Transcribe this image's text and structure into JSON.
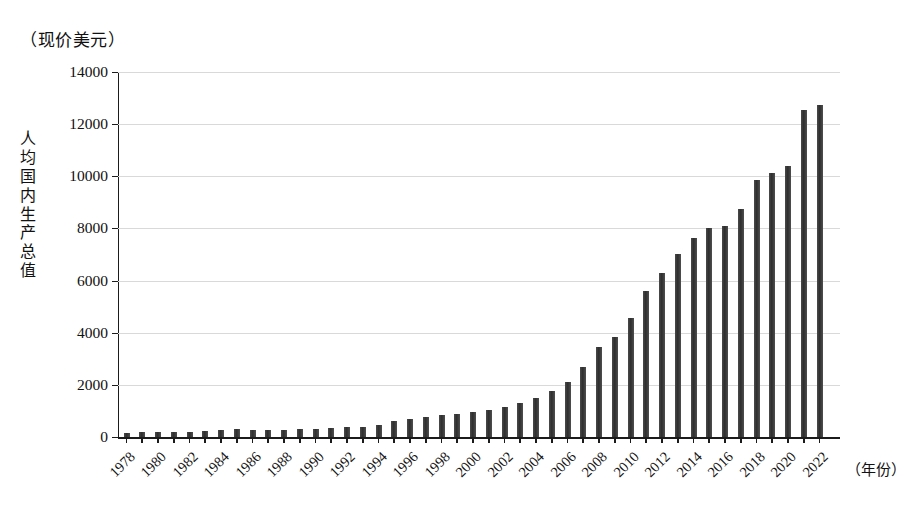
{
  "chart_data": {
    "type": "bar",
    "title": "",
    "unit_caption": "（现价美元）",
    "ylabel": "人均国内生产总值",
    "xlabel": "（年份）",
    "ylim": [
      0,
      14000
    ],
    "ytick_values": [
      0,
      2000,
      4000,
      6000,
      8000,
      10000,
      12000,
      14000
    ],
    "ytick_labels": [
      "0",
      "2000",
      "4000",
      "6000",
      "8000",
      "10000",
      "12000",
      "14000"
    ],
    "grid": "horizontal",
    "legend": "none",
    "bar_color": "#3c3c3c",
    "xtick_labels": [
      "1978",
      "1980",
      "1982",
      "1984",
      "1986",
      "1988",
      "1990",
      "1992",
      "1994",
      "1996",
      "1998",
      "2000",
      "2002",
      "2004",
      "2006",
      "2008",
      "2010",
      "2012",
      "2014",
      "2016",
      "2018",
      "2020",
      "2022"
    ],
    "categories": [
      "1978",
      "1979",
      "1980",
      "1981",
      "1982",
      "1983",
      "1984",
      "1985",
      "1986",
      "1987",
      "1988",
      "1989",
      "1990",
      "1991",
      "1992",
      "1993",
      "1994",
      "1995",
      "1996",
      "1997",
      "1998",
      "1999",
      "2000",
      "2001",
      "2002",
      "2003",
      "2004",
      "2005",
      "2006",
      "2007",
      "2008",
      "2009",
      "2010",
      "2011",
      "2012",
      "2013",
      "2014",
      "2015",
      "2016",
      "2017",
      "2018",
      "2019",
      "2020",
      "2021",
      "2022"
    ],
    "values": [
      156,
      184,
      195,
      197,
      204,
      225,
      251,
      294,
      282,
      251,
      284,
      311,
      318,
      333,
      366,
      377,
      473,
      609,
      709,
      781,
      828,
      873,
      959,
      1053,
      1148,
      1288,
      1508,
      1753,
      2099,
      2693,
      3468,
      3832,
      4550,
      5618,
      6301,
      7020,
      7636,
      8016,
      8094,
      8760,
      9849,
      10144,
      10409,
      12556,
      12720
    ]
  }
}
